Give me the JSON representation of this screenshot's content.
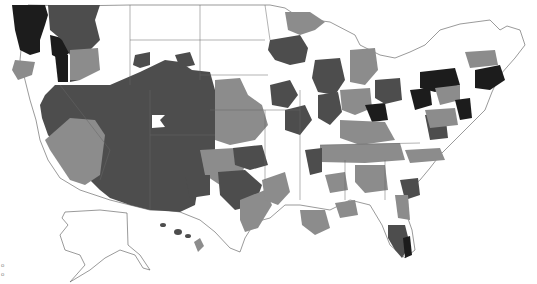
{
  "map": {
    "type": "choropleth",
    "region": "United States (contiguous + Alaska + Hawaii)",
    "units": "sub-state regions (grayscale classes)",
    "palette": {
      "class_0": "#ffffff",
      "class_1": "#8c8c8c",
      "class_2": "#4d4d4d",
      "class_3": "#1c1c1c",
      "border": "#555555"
    },
    "corner_marks": [
      "o",
      "o"
    ],
    "legend_visible": false,
    "title_visible": false
  }
}
